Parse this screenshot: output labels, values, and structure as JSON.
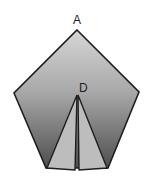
{
  "diagram": {
    "type": "geometry",
    "shape": "pentagon",
    "labels": {
      "A": "A",
      "D": "D"
    },
    "colors": {
      "gradient_top": "#d4d4d4",
      "gradient_bottom": "#555555",
      "inner_fill": "#bcbcbc",
      "stroke": "#1e1e1e"
    }
  }
}
